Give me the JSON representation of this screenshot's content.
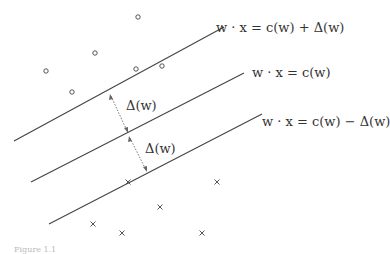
{
  "figure": {
    "type": "diagram",
    "lines": [
      {
        "id": "upper",
        "label": "w · x = c(w) + Δ(w)",
        "x1": 14,
        "y1": 141,
        "x2": 224,
        "y2": 27
      },
      {
        "id": "middle",
        "label": "w · x = c(w)",
        "x1": 31,
        "y1": 182,
        "x2": 244,
        "y2": 73
      },
      {
        "id": "lower",
        "label": "w · x = c(w) − Δ(w)",
        "x1": 49,
        "y1": 224,
        "x2": 262,
        "y2": 114
      }
    ],
    "margin_labels": [
      "Δ(w)",
      "Δ(w)"
    ],
    "circles": [
      [
        138,
        17
      ],
      [
        95,
        53
      ],
      [
        46,
        71
      ],
      [
        136,
        69
      ],
      [
        72,
        92
      ],
      [
        162,
        66
      ]
    ],
    "crosses": [
      [
        128,
        182
      ],
      [
        217,
        182
      ],
      [
        160,
        207
      ],
      [
        93,
        224
      ],
      [
        122,
        233
      ],
      [
        202,
        233
      ]
    ],
    "caption": "Figure 1.1"
  },
  "colors": {
    "line": "#444444",
    "marker": "#555555",
    "arrow": "#666666"
  }
}
